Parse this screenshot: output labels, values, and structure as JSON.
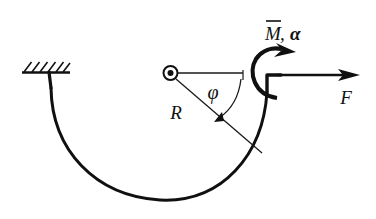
{
  "figure": {
    "type": "engineering-mechanics-diagram",
    "background_color": "#ffffff",
    "ink_color": "#101010",
    "width": 376,
    "height": 219
  },
  "labels": {
    "radius": "R",
    "angle": "φ",
    "force": "F",
    "moment": "M",
    "moment_overbar": true,
    "moment_group": "M̄, α",
    "alpha": "α",
    "comma": ","
  },
  "elements": {
    "support": {
      "name": "fixed-support",
      "hatch_count": 6,
      "base_line_x1": 22,
      "base_line_x2": 70,
      "base_line_y": 72
    },
    "center": {
      "name": "center-of-curvature",
      "cx": 170,
      "cy": 73,
      "outer_radius": 7,
      "inner_radius": 3
    },
    "arc": {
      "name": "curved-bar",
      "radius": 97,
      "stroke_width": 3.1,
      "start_angle_deg": 180,
      "end_angle_deg": 0
    },
    "reference_line": {
      "name": "horizontal-reference-line",
      "x1": 178,
      "x2": 243,
      "y": 73
    },
    "radius_line": {
      "name": "radius-line",
      "angle_deg": 52
    },
    "angle_arc": {
      "name": "angle-arc-phi",
      "radius": 68
    },
    "force_arrow": {
      "name": "force-arrow-F",
      "x1": 276,
      "x2": 358,
      "y": 75,
      "direction": "right"
    },
    "moment_arrow": {
      "name": "moment-arrow",
      "direction": "clockwise"
    }
  }
}
